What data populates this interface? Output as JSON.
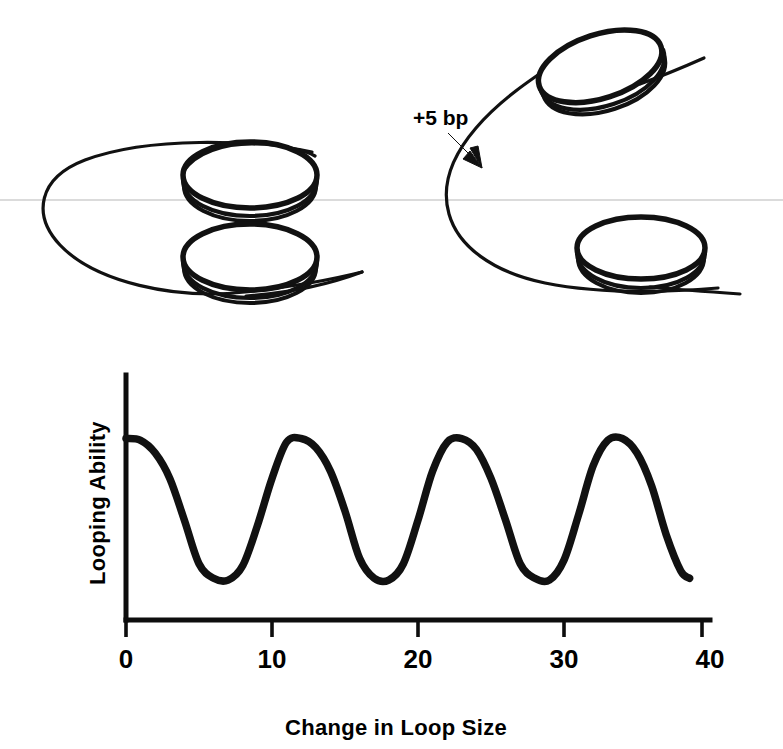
{
  "figure": {
    "domain": "chart-with-diagram",
    "background_color": "#ffffff",
    "ink_color": "#111111",
    "scan_line_color": "#cfcfcf"
  },
  "schematic": {
    "annotation_label": "+5 bp",
    "left_model": {
      "name": "aligned-loop-model",
      "description": "DNA loop with two protein discs stacked in register",
      "disc_count": 2
    },
    "right_model": {
      "name": "misaligned-loop-model",
      "description": "DNA loop with two protein discs rotated out of register after a five base pair insertion",
      "disc_count": 2
    }
  },
  "chart_data": {
    "type": "line",
    "title": "",
    "xlabel": "Change in Loop Size",
    "ylabel": "Looping Ability",
    "xlim": [
      0,
      40
    ],
    "ylim": [
      0,
      1.35
    ],
    "grid": false,
    "legend": "none",
    "xticks": [
      0,
      10,
      20,
      30,
      40
    ],
    "xticklabels": [
      "0",
      "10",
      "20",
      "30",
      "40"
    ],
    "yticks": [],
    "yticklabels": [],
    "period": 10,
    "peak_value": 1.0,
    "trough_value": 0.22,
    "x": [
      0,
      1,
      2,
      3,
      4,
      5,
      6,
      7,
      8,
      9,
      10,
      11,
      12,
      13,
      14,
      15,
      16,
      17,
      18,
      19,
      20,
      21,
      22,
      23,
      24,
      25,
      26,
      27,
      28,
      29,
      30,
      31,
      32,
      33,
      34,
      35,
      36,
      37,
      38,
      38.6
    ],
    "values": [
      1.0,
      0.99,
      0.92,
      0.78,
      0.55,
      0.31,
      0.23,
      0.22,
      0.3,
      0.52,
      0.78,
      0.98,
      1.0,
      0.95,
      0.82,
      0.6,
      0.34,
      0.23,
      0.22,
      0.31,
      0.55,
      0.82,
      0.98,
      1.0,
      0.94,
      0.78,
      0.55,
      0.31,
      0.23,
      0.22,
      0.33,
      0.58,
      0.85,
      0.99,
      1.0,
      0.92,
      0.74,
      0.47,
      0.27,
      0.23
    ],
    "series_note": "Looping ability oscillates with a roughly 10 base pair helical periodicity; maxima near 0, 10, 20 and 30, minima near 5, 15, 25 and 35.",
    "peaks_x": [
      0,
      10.5,
      20,
      30
    ],
    "troughs_x": [
      5,
      15,
      25,
      35
    ],
    "curve_end_x": 38.6
  }
}
